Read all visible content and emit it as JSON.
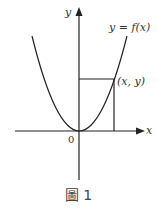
{
  "figure": {
    "caption": "圖 1",
    "labels": {
      "y_axis": "y",
      "x_axis": "x",
      "origin": "0",
      "curve": "y = f(x)",
      "point": "(x, y)"
    },
    "colors": {
      "stroke": "#222222",
      "text": "#333333"
    }
  }
}
